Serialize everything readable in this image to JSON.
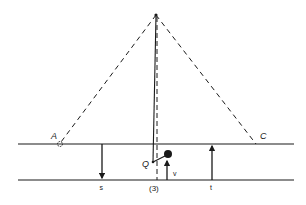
{
  "diagram": {
    "colors": {
      "stroke": "#1a1a1a",
      "background": "#ffffff"
    },
    "labels": {
      "A": "A",
      "C": "C",
      "Q": "Q",
      "s": "s",
      "t": "t",
      "v": "v",
      "figure_number": "(3)"
    },
    "points": {
      "apex": [
        156,
        15
      ],
      "A": [
        60,
        143
      ],
      "C": [
        256,
        144
      ],
      "Q": [
        153,
        162
      ],
      "dot": [
        168,
        154
      ]
    },
    "lines": {
      "upper_y": 144,
      "lower_y": 180,
      "x_start": 18,
      "x_end": 294
    },
    "arrows": [
      {
        "name": "s",
        "x": 102,
        "direction": "down"
      },
      {
        "name": "v",
        "x": 167,
        "direction": "up"
      },
      {
        "name": "t",
        "x": 212,
        "direction": "up"
      }
    ]
  }
}
